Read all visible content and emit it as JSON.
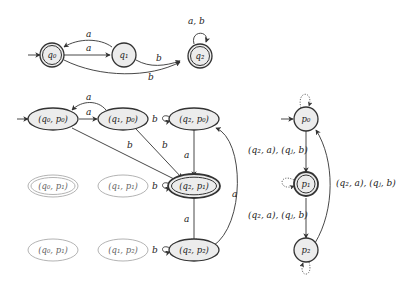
{
  "top_automaton": {
    "states": [
      {
        "id": "q0",
        "label": "q₀",
        "accepting": true,
        "initial": true
      },
      {
        "id": "q1",
        "label": "q₁",
        "accepting": false,
        "initial": false
      },
      {
        "id": "q2",
        "label": "q₂",
        "accepting": true,
        "initial": false
      }
    ],
    "transitions": [
      {
        "from": "q0",
        "to": "q1",
        "label": "a"
      },
      {
        "from": "q1",
        "to": "q0",
        "label": "a"
      },
      {
        "from": "q1",
        "to": "q2",
        "label": "b"
      },
      {
        "from": "q0",
        "to": "q2",
        "label": "b"
      },
      {
        "from": "q2",
        "to": "q2",
        "label": "a, b"
      }
    ]
  },
  "product_automaton": {
    "states": [
      {
        "id": "q0p0",
        "label": "(q₀, p₀)",
        "active": true,
        "initial": true
      },
      {
        "id": "q1p0",
        "label": "(q₁, p₀)",
        "active": true
      },
      {
        "id": "q2p0",
        "label": "(q₂, p₀)",
        "active": true
      },
      {
        "id": "q0p1",
        "label": "(q₀, p₁)",
        "active": false,
        "double": true
      },
      {
        "id": "q1p1",
        "label": "(q₁, p₁)",
        "active": false
      },
      {
        "id": "q2p1",
        "label": "(q₂, p₁)",
        "active": true,
        "accepting": true
      },
      {
        "id": "q0p1b",
        "label": "(q₀, p₁)",
        "active": false
      },
      {
        "id": "q1p2",
        "label": "(q₁, p₂)",
        "active": false
      },
      {
        "id": "q2p2",
        "label": "(q₂, p₂)",
        "active": true
      }
    ],
    "transitions": [
      {
        "from": "q0p0",
        "to": "q1p0",
        "label": "a"
      },
      {
        "from": "q1p0",
        "to": "q0p0",
        "label": "a"
      },
      {
        "from": "q0p0",
        "to": "q2p1",
        "label": "b"
      },
      {
        "from": "q1p0",
        "to": "q2p1",
        "label": "b"
      },
      {
        "from": "q2p0",
        "to": "q2p0",
        "label": "b"
      },
      {
        "from": "q2p0",
        "to": "q2p1",
        "label": "a"
      },
      {
        "from": "q1p1",
        "to": "q2p1",
        "label": "b"
      },
      {
        "from": "q2p1",
        "to": "q2p2",
        "label": "a"
      },
      {
        "from": "q1p2",
        "to": "q2p2",
        "label": "b"
      },
      {
        "from": "q2p2",
        "to": "q2p0",
        "label": "a"
      }
    ]
  },
  "right_automaton": {
    "states": [
      {
        "id": "p0",
        "label": "p₀",
        "initial": true
      },
      {
        "id": "p1",
        "label": "p₁",
        "accepting": true
      },
      {
        "id": "p2",
        "label": "p₂"
      }
    ],
    "transitions": [
      {
        "from": "p0",
        "to": "p1",
        "label": "(q₂, a), (qⱼ, b)"
      },
      {
        "from": "p1",
        "to": "p2",
        "label": "(q₂, a), (qⱼ, b)"
      },
      {
        "from": "p2",
        "to": "p0",
        "label": "(q₂, a), (qⱼ, b)"
      }
    ]
  },
  "labels": {
    "a": "a",
    "b": "b",
    "ab": "a, b"
  }
}
